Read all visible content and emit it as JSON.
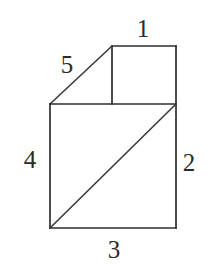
{
  "figure": {
    "name": "labeled-polygon-diagram",
    "background_color": "#ffffff",
    "stroke_color": "#2e2e2e",
    "label_color": "#2b2b2b",
    "canvas": {
      "width": 216,
      "height": 268
    },
    "vertices": {
      "lower_square_top_left": [
        50,
        104
      ],
      "lower_square_top_right": [
        176,
        104
      ],
      "lower_square_bottom_right": [
        176,
        228
      ],
      "lower_square_bottom_left": [
        50,
        228
      ],
      "upper_square_top_left": [
        112,
        46
      ],
      "upper_square_top_right": [
        176,
        46
      ]
    },
    "segments": [
      {
        "name": "upper-top-edge",
        "from": [
          112,
          46
        ],
        "to": [
          176,
          46
        ],
        "style": "edge"
      },
      {
        "name": "upper-right-edge",
        "from": [
          176,
          46
        ],
        "to": [
          176,
          104
        ],
        "style": "edge"
      },
      {
        "name": "upper-inner-divider",
        "from": [
          112,
          46
        ],
        "to": [
          112,
          104
        ],
        "style": "edge"
      },
      {
        "name": "upper-slant-edge",
        "from": [
          50,
          104
        ],
        "to": [
          112,
          46
        ],
        "style": "diagonal"
      },
      {
        "name": "square-top-edge",
        "from": [
          50,
          104
        ],
        "to": [
          176,
          104
        ],
        "style": "edge"
      },
      {
        "name": "square-right-edge",
        "from": [
          176,
          104
        ],
        "to": [
          176,
          228
        ],
        "style": "edge"
      },
      {
        "name": "square-bottom-edge",
        "from": [
          50,
          228
        ],
        "to": [
          176,
          228
        ],
        "style": "edge"
      },
      {
        "name": "square-left-edge",
        "from": [
          50,
          104
        ],
        "to": [
          50,
          228
        ],
        "style": "edge"
      },
      {
        "name": "square-diagonal",
        "from": [
          50,
          228
        ],
        "to": [
          176,
          104
        ],
        "style": "diagonal"
      }
    ],
    "labels": {
      "label_1": "1",
      "label_2": "2",
      "label_3": "3",
      "label_4": "4",
      "label_5": "5"
    },
    "label_positions": {
      "label_1": [
        143,
        29
      ],
      "label_2": [
        189,
        163
      ],
      "label_3": [
        114,
        250
      ],
      "label_4": [
        30,
        160
      ],
      "label_5": [
        67,
        65
      ]
    }
  }
}
